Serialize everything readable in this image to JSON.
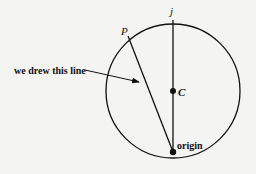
{
  "diagram": {
    "labels": {
      "j": "j",
      "p": "P",
      "c": "C",
      "origin": "origin",
      "annotation": "we drew this line"
    },
    "colors": {
      "stroke": "#111111",
      "background": "#f4f4f2"
    }
  }
}
